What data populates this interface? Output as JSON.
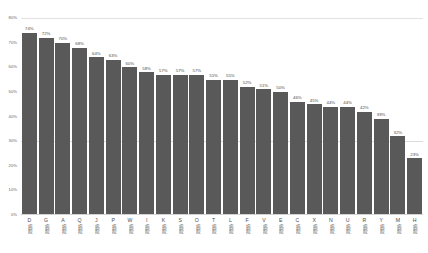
{
  "chart_data": {
    "type": "bar",
    "title": "",
    "subtitle": "",
    "xlabel": "",
    "ylabel": "",
    "ylim": [
      0,
      80
    ],
    "grid": true,
    "legend": false,
    "value_label_suffix": "%",
    "category_suffix": "病院",
    "ytick_labels": [
      "80%",
      "70%",
      "60%",
      "50%",
      "40%",
      "30%",
      "20%",
      "10%",
      "0%"
    ],
    "ytick_values": [
      80,
      70,
      60,
      50,
      40,
      30,
      20,
      10,
      0
    ],
    "categories": [
      "D病院",
      "G病院",
      "A病院",
      "Q病院",
      "J病院",
      "P病院",
      "W病院",
      "I病院",
      "K病院",
      "S病院",
      "O病院",
      "T病院",
      "L病院",
      "F病院",
      "V病院",
      "E病院",
      "C病院",
      "X病院",
      "N病院",
      "U病院",
      "R病院",
      "Y病院",
      "M病院",
      "H病院"
    ],
    "category_letters": [
      "D",
      "G",
      "A",
      "Q",
      "J",
      "P",
      "W",
      "I",
      "K",
      "S",
      "O",
      "T",
      "L",
      "F",
      "V",
      "E",
      "C",
      "X",
      "N",
      "U",
      "R",
      "Y",
      "M",
      "H"
    ],
    "values": [
      74,
      72,
      70,
      68,
      64,
      63,
      60,
      58,
      57,
      57,
      57,
      55,
      55,
      52,
      51,
      50,
      46,
      45,
      44,
      44,
      42,
      39,
      32,
      23
    ],
    "value_labels": [
      "74%",
      "72%",
      "70%",
      "68%",
      "64%",
      "63%",
      "60%",
      "58%",
      "57%",
      "57%",
      "57%",
      "55%",
      "55%",
      "52%",
      "51%",
      "50%",
      "46%",
      "45%",
      "44%",
      "44%",
      "42%",
      "39%",
      "32%",
      "23%"
    ],
    "colors": {
      "bar": "#595959",
      "gridline": "#e2e2e2",
      "axis_text": "#5f5f5f",
      "label_text": "#4a4a4a",
      "background": "#ffffff"
    }
  }
}
